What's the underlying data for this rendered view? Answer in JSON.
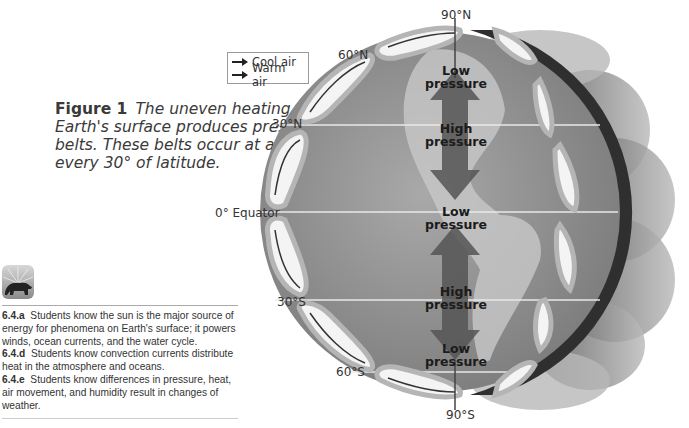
{
  "legend": {
    "items": [
      {
        "icon": "arrow-right-icon",
        "label": "Cool air"
      },
      {
        "icon": "arrow-right-icon",
        "label": "Warm air"
      }
    ]
  },
  "caption": {
    "figure_label": "Figure 1",
    "text": "The uneven heating of Earth's surface produces pressure belts. These belts occur at about every 30° of latitude."
  },
  "latitudes": {
    "n90": "90°N",
    "n60": "60°N",
    "n30": "30°N",
    "eq": "0° Equator",
    "s30": "30°S",
    "s60": "60°S",
    "s90": "90°S"
  },
  "pressure_labels": [
    {
      "line1": "Low",
      "line2": "pressure"
    },
    {
      "line1": "High",
      "line2": "pressure"
    },
    {
      "line1": "Low",
      "line2": "pressure"
    },
    {
      "line1": "High",
      "line2": "pressure"
    },
    {
      "line1": "Low",
      "line2": "pressure"
    }
  ],
  "standards": [
    {
      "code": "6.4.a",
      "text": "Students know the sun is the major source of energy for phenomena on Earth's surface; it powers winds, ocean currents, and the water cycle."
    },
    {
      "code": "6.4.d",
      "text": "Students know convection currents distribute heat in the atmosphere and oceans."
    },
    {
      "code": "6.4.e",
      "text": "Students know differences in pressure, heat, air movement, and humidity result in changes of weather."
    }
  ],
  "colors": {
    "globe": "#8f8f8f",
    "cell_fill": "#f4f4f4",
    "cell_border": "#b5b5b5",
    "arrow": "#5a5a5a",
    "shadow_band": "#2f2f2f"
  }
}
